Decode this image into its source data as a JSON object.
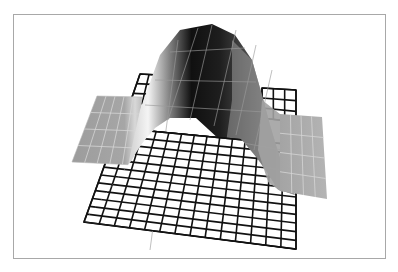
{
  "figure": {
    "frame": {
      "x": 13,
      "y": 14,
      "w": 373,
      "h": 245,
      "border": "#a8a8a8"
    },
    "colors": {
      "grid_line": "#111111",
      "grid_fill": "#ffffff",
      "flap_fill": "#a9a9a9",
      "flap_line": "#d6d6d6",
      "hump_dark": "#0c0c0c",
      "hump_mid": "#6a6a6a",
      "hump_light": "#f2f2f2",
      "hump_line": "#9a9a9a"
    },
    "base_grid": {
      "corners": {
        "tl": [
          104,
          170
        ],
        "tr": [
          296,
          190
        ],
        "br": [
          296,
          249
        ],
        "bl": [
          84,
          222
        ]
      },
      "cols": 14,
      "rows": 4
    },
    "back_grid_left": {
      "corners": {
        "tl": [
          140,
          74
        ],
        "tr": [
          158,
          75
        ],
        "br": [
          154,
          104
        ],
        "bl": [
          130,
          103
        ]
      },
      "cols": 2,
      "rows": 3
    },
    "back_grid_right": {
      "corners": {
        "tl": [
          262,
          88
        ],
        "tr": [
          296,
          90
        ],
        "br": [
          296,
          122
        ],
        "bl": [
          262,
          118
        ]
      },
      "cols": 3,
      "rows": 3
    },
    "inner_grid": {
      "corners": {
        "tl": [
          156,
          113
        ],
        "tr": [
          258,
          125
        ],
        "br": [
          296,
          190
        ],
        "bl": [
          104,
          170
        ]
      },
      "cols": 11,
      "rows": 6
    },
    "left_flap": {
      "polygon": [
        [
          97,
          96
        ],
        [
          142,
          97
        ],
        [
          135,
          165
        ],
        [
          72,
          162
        ]
      ],
      "cols": 5,
      "rows": 4
    },
    "right_flap": {
      "polygon": [
        [
          280,
          114
        ],
        [
          322,
          117
        ],
        [
          327,
          199
        ],
        [
          280,
          191
        ]
      ],
      "cols": 4,
      "rows": 4
    },
    "hump": {
      "outline": [
        [
          128,
          165
        ],
        [
          140,
          110
        ],
        [
          160,
          55
        ],
        [
          180,
          30
        ],
        [
          212,
          24
        ],
        [
          235,
          35
        ],
        [
          252,
          60
        ],
        [
          262,
          95
        ],
        [
          270,
          125
        ],
        [
          285,
          175
        ],
        [
          295,
          195
        ],
        [
          250,
          180
        ],
        [
          220,
          140
        ],
        [
          196,
          118
        ],
        [
          170,
          118
        ],
        [
          155,
          128
        ],
        [
          140,
          150
        ]
      ],
      "ridge_lines_x": [
        [
          150,
          178,
          40,
          250
        ],
        [
          168,
          198,
          28,
          120
        ],
        [
          190,
          212,
          25,
          120
        ],
        [
          214,
          236,
          30,
          126
        ],
        [
          236,
          256,
          45,
          135
        ],
        [
          254,
          272,
          70,
          150
        ]
      ],
      "cross_lines": [
        [
          [
            170,
            52
          ],
          [
            245,
            48
          ]
        ],
        [
          [
            155,
            80
          ],
          [
            256,
            82
          ]
        ],
        [
          [
            145,
            105
          ],
          [
            265,
            112
          ]
        ],
        [
          [
            210,
            137
          ],
          [
            282,
            150
          ]
        ],
        [
          [
            225,
            160
          ],
          [
            292,
            172
          ]
        ]
      ]
    }
  }
}
